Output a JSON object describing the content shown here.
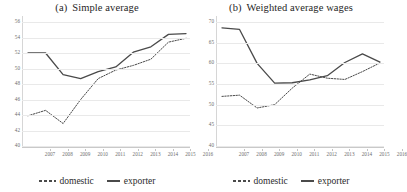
{
  "figure": {
    "legend": {
      "domestic_label": "domestic",
      "exporter_label": "exporter",
      "domestic_style": "dashed",
      "exporter_style": "solid",
      "line_color": "#4a4a4a"
    }
  },
  "chart_data": [
    {
      "type": "line",
      "title": "Simple average",
      "panel_label": "(a)",
      "xlabel": "",
      "ylabel": "",
      "x": [
        "2007",
        "2008",
        "2009",
        "2010",
        "2011",
        "2012",
        "2013",
        "2014",
        "2015",
        "2016"
      ],
      "ylim": [
        40,
        56
      ],
      "yticks": [
        40,
        42,
        44,
        46,
        48,
        50,
        52,
        54,
        56
      ],
      "grid": true,
      "legend_position": "bottom",
      "series": [
        {
          "name": "exporter",
          "style": "solid",
          "values": [
            52.0,
            52.0,
            49.2,
            48.7,
            49.6,
            50.2,
            52.1,
            52.8,
            54.4,
            54.5
          ]
        },
        {
          "name": "domestic",
          "style": "dashed",
          "values": [
            43.9,
            44.6,
            42.9,
            46.0,
            48.7,
            49.8,
            50.4,
            51.2,
            53.4,
            53.9
          ]
        }
      ]
    },
    {
      "type": "line",
      "title": "Weighted average wages",
      "panel_label": "(b)",
      "xlabel": "",
      "ylabel": "",
      "x": [
        "2007",
        "2008",
        "2009",
        "2010",
        "2011",
        "2012",
        "2013",
        "2014",
        "2015",
        "2016"
      ],
      "ylim": [
        40,
        70
      ],
      "yticks": [
        40,
        45,
        50,
        55,
        60,
        65,
        70
      ],
      "grid": true,
      "legend_position": "bottom",
      "series": [
        {
          "name": "exporter",
          "style": "solid",
          "values": [
            68.6,
            68.2,
            60.0,
            55.2,
            55.3,
            56.0,
            57.0,
            60.2,
            62.3,
            60.3
          ]
        },
        {
          "name": "domestic",
          "style": "dashed",
          "values": [
            52.0,
            52.3,
            49.2,
            50.0,
            54.0,
            57.4,
            56.4,
            56.1,
            58.0,
            60.1
          ]
        }
      ]
    }
  ]
}
